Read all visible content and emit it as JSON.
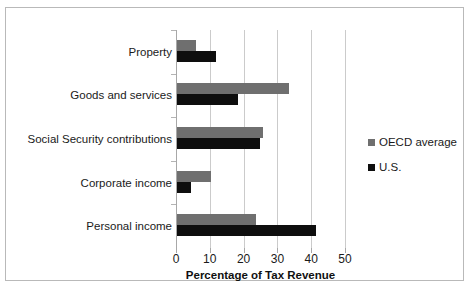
{
  "chart_data": {
    "type": "bar",
    "orientation": "horizontal",
    "title": "",
    "xlabel": "Percentage of Tax Revenue",
    "ylabel": "",
    "categories": [
      "Personal income",
      "Corporate income",
      "Social Security contributions",
      "Goods and services",
      "Property"
    ],
    "series": [
      {
        "name": "OECD average",
        "color": "#6f6f6f",
        "values": [
          23.5,
          10.0,
          25.5,
          33.0,
          5.5
        ]
      },
      {
        "name": "U.S.",
        "color": "#0e0e0e",
        "values": [
          41.0,
          4.0,
          24.5,
          18.0,
          11.5
        ]
      }
    ],
    "xlim": [
      0,
      50
    ],
    "xticks": [
      0,
      10,
      20,
      30,
      40,
      50
    ],
    "xtick_labels": [
      "0",
      "10",
      "20",
      "30",
      "40",
      "50"
    ],
    "grid": true,
    "grid_axis": "x",
    "legend_position": "right",
    "frame": true
  },
  "colors": {
    "oecd": "#6f6f6f",
    "us": "#0e0e0e",
    "gridline": "#cbcbcb",
    "axis": "#a8a8a8",
    "frame": "#b9b9b9",
    "background": "#ffffff",
    "text": "#1a1a1a"
  },
  "legend": {
    "items": [
      {
        "label": "OECD average",
        "color": "#6f6f6f"
      },
      {
        "label": "U.S.",
        "color": "#0e0e0e"
      }
    ]
  }
}
